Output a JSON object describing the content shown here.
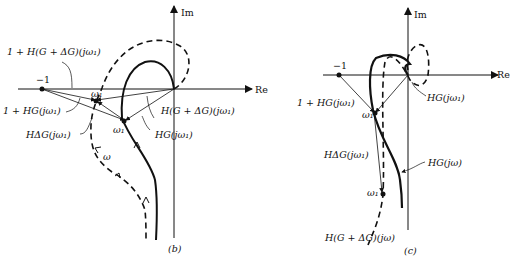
{
  "panels": [
    {
      "id": "b",
      "caption": "(b)",
      "axes": {
        "real": "Re",
        "imag": "Im"
      },
      "point_minus_one": "−1",
      "labels": {
        "one_plus_h_g_dg": "1 + H(G + ΔG)(jω₁)",
        "one_plus_hg": "1 + HG(jω₁)",
        "h_g_dg": "H(G + ΔG)(jω₁)",
        "h_dg": "HΔG(jω₁)",
        "hg": "HG(jω₁)",
        "omega1_top": "ω₁",
        "omega1_bottom": "ω₁",
        "omega": "ω"
      }
    },
    {
      "id": "c",
      "caption": "(c)",
      "axes": {
        "real": "Re",
        "imag": "Im"
      },
      "point_minus_one": "−1",
      "labels": {
        "one_plus_hg": "1 + HG(jω₁)",
        "hg_w1": "HG(jω₁)",
        "omega1_top": "ω₁",
        "h_dg": "HΔG(jω₁)",
        "hg_w": "HG(jω)",
        "omega1_bottom": "ω₁",
        "h_g_dg_w": "H(G + ΔG)(jω)"
      }
    }
  ]
}
